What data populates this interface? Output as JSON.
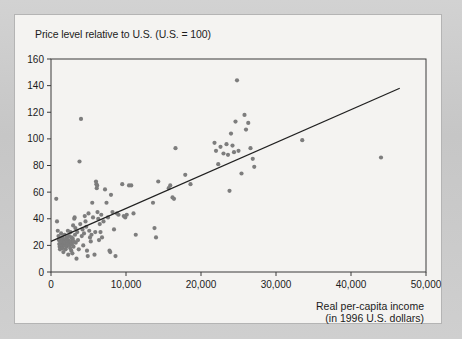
{
  "figure": {
    "panel_background": "#f4f3f1",
    "surround_background": "#cccccc",
    "border_color": "#b4b4b4"
  },
  "chart_data": {
    "type": "scatter",
    "title": "Price level relative to U.S. (U.S. = 100)",
    "xlabel_line1": "Real per-capita income",
    "xlabel_line2": "(in 1996 U.S. dollars)",
    "ylabel": "Price level relative to U.S. (U.S. = 100)",
    "xlim": [
      0,
      50000
    ],
    "ylim": [
      0,
      160
    ],
    "grid": false,
    "legend": "none",
    "marker_color": "#7d7d7d",
    "marker_size_px": 4.2,
    "xticks": [
      0,
      10000,
      20000,
      30000,
      40000,
      50000
    ],
    "xtick_labels": [
      "0",
      "10,000",
      "20,000",
      "30,000",
      "40,000",
      "50,000"
    ],
    "yticks": [
      0,
      20,
      40,
      60,
      80,
      100,
      120,
      140,
      160
    ],
    "ytick_labels": [
      "0",
      "20",
      "40",
      "60",
      "80",
      "100",
      "120",
      "140",
      "160"
    ],
    "trendline": {
      "label": "fitted regression line",
      "color": "#202020",
      "x_start": 0,
      "y_start": 23,
      "x_end": 46500,
      "y_end": 138
    },
    "points": [
      [
        700,
        55
      ],
      [
        800,
        38
      ],
      [
        900,
        31
      ],
      [
        1000,
        27
      ],
      [
        1050,
        24
      ],
      [
        1100,
        21
      ],
      [
        1150,
        19
      ],
      [
        1200,
        17
      ],
      [
        1250,
        23
      ],
      [
        1300,
        25
      ],
      [
        1350,
        29
      ],
      [
        1400,
        22
      ],
      [
        1450,
        20
      ],
      [
        1500,
        26
      ],
      [
        1550,
        18
      ],
      [
        1600,
        24
      ],
      [
        1650,
        15
      ],
      [
        1700,
        21
      ],
      [
        1750,
        23
      ],
      [
        1800,
        28
      ],
      [
        1850,
        20
      ],
      [
        1900,
        22
      ],
      [
        1950,
        17
      ],
      [
        2000,
        25
      ],
      [
        2050,
        19
      ],
      [
        2100,
        26
      ],
      [
        2150,
        23
      ],
      [
        2200,
        21
      ],
      [
        2250,
        31
      ],
      [
        2300,
        13
      ],
      [
        2350,
        24
      ],
      [
        2400,
        27
      ],
      [
        2450,
        22
      ],
      [
        2500,
        20
      ],
      [
        2550,
        18
      ],
      [
        2600,
        30
      ],
      [
        2650,
        23
      ],
      [
        2700,
        16
      ],
      [
        2750,
        26
      ],
      [
        2800,
        21
      ],
      [
        2850,
        14
      ],
      [
        2900,
        25
      ],
      [
        2950,
        35
      ],
      [
        3000,
        19
      ],
      [
        3050,
        23
      ],
      [
        3100,
        40
      ],
      [
        3150,
        41
      ],
      [
        3200,
        28
      ],
      [
        3250,
        33
      ],
      [
        3300,
        22
      ],
      [
        3400,
        10
      ],
      [
        3500,
        30
      ],
      [
        3600,
        24
      ],
      [
        3700,
        17
      ],
      [
        3800,
        83
      ],
      [
        3900,
        36
      ],
      [
        4000,
        115
      ],
      [
        4100,
        27
      ],
      [
        4200,
        32
      ],
      [
        4300,
        20
      ],
      [
        4400,
        29
      ],
      [
        4500,
        42
      ],
      [
        4600,
        38
      ],
      [
        4700,
        34
      ],
      [
        4800,
        16
      ],
      [
        4900,
        12
      ],
      [
        5000,
        44
      ],
      [
        5100,
        31
      ],
      [
        5200,
        26
      ],
      [
        5300,
        23
      ],
      [
        5400,
        28
      ],
      [
        5500,
        52
      ],
      [
        5600,
        41
      ],
      [
        5800,
        13
      ],
      [
        5900,
        30
      ],
      [
        6000,
        68
      ],
      [
        6050,
        66
      ],
      [
        6100,
        63
      ],
      [
        6150,
        65
      ],
      [
        6200,
        45
      ],
      [
        6300,
        40
      ],
      [
        6400,
        24
      ],
      [
        6500,
        36
      ],
      [
        6600,
        30
      ],
      [
        6700,
        43
      ],
      [
        6800,
        26
      ],
      [
        7000,
        38
      ],
      [
        7200,
        62
      ],
      [
        7400,
        52
      ],
      [
        7600,
        41
      ],
      [
        7800,
        16
      ],
      [
        7900,
        15
      ],
      [
        8000,
        58
      ],
      [
        8200,
        45
      ],
      [
        8400,
        32
      ],
      [
        8600,
        12
      ],
      [
        8800,
        44
      ],
      [
        9000,
        43
      ],
      [
        9500,
        66
      ],
      [
        9700,
        42
      ],
      [
        9900,
        41
      ],
      [
        10100,
        43
      ],
      [
        10400,
        65
      ],
      [
        10700,
        65
      ],
      [
        11000,
        44
      ],
      [
        11300,
        28
      ],
      [
        13600,
        52
      ],
      [
        13800,
        33
      ],
      [
        14000,
        26
      ],
      [
        14300,
        68
      ],
      [
        15700,
        63
      ],
      [
        15900,
        65
      ],
      [
        16200,
        56
      ],
      [
        16400,
        55
      ],
      [
        16600,
        93
      ],
      [
        17900,
        73
      ],
      [
        18600,
        66
      ],
      [
        21800,
        97
      ],
      [
        22000,
        91
      ],
      [
        22300,
        81
      ],
      [
        22600,
        94
      ],
      [
        23000,
        89
      ],
      [
        23400,
        96
      ],
      [
        23600,
        88
      ],
      [
        23800,
        61
      ],
      [
        24000,
        104
      ],
      [
        24200,
        95
      ],
      [
        24400,
        90
      ],
      [
        24600,
        113
      ],
      [
        24800,
        144
      ],
      [
        25000,
        91
      ],
      [
        25400,
        74
      ],
      [
        25800,
        118
      ],
      [
        26000,
        107
      ],
      [
        26300,
        112
      ],
      [
        26600,
        93
      ],
      [
        26900,
        85
      ],
      [
        27100,
        79
      ],
      [
        33500,
        99
      ],
      [
        44000,
        86
      ]
    ]
  }
}
